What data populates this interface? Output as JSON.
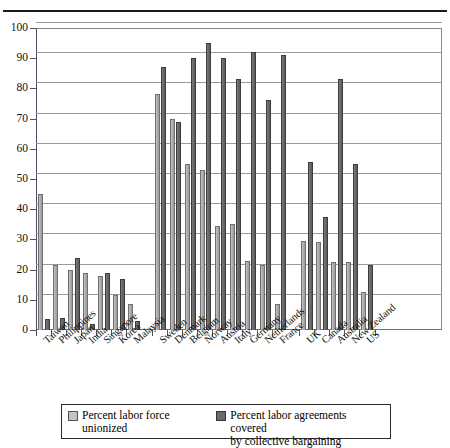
{
  "chart_data": {
    "type": "bar",
    "title": "",
    "xlabel": "",
    "ylabel": "",
    "ylim": [
      0,
      100
    ],
    "ytick_step": 10,
    "yticks": [
      100,
      90,
      80,
      70,
      60,
      50,
      40,
      30,
      20,
      10,
      0
    ],
    "grid": true,
    "legend_position": "bottom",
    "categories": [
      "Taiwan",
      "Philippines",
      "Japan",
      "India",
      "Singapore",
      "Korea",
      "Malaysia",
      "Sweden",
      "Denmark",
      "Belgium",
      "Norway",
      "Austria",
      "Italy",
      "Germany",
      "Netherlands",
      "France",
      "UK",
      "Canada",
      "Australia",
      "New Zealand",
      "US"
    ],
    "groups": [
      {
        "name": "asia",
        "categories": [
          "Taiwan",
          "Philippines",
          "Japan",
          "India",
          "Singapore",
          "Korea",
          "Malaysia"
        ]
      },
      {
        "name": "europe",
        "categories": [
          "Sweden",
          "Denmark",
          "Belgium",
          "Norway",
          "Austria",
          "Italy",
          "Germany",
          "Netherlands",
          "France"
        ]
      },
      {
        "name": "anglo",
        "categories": [
          "UK",
          "Canada",
          "Australia",
          "New Zealand",
          "US"
        ]
      }
    ],
    "series": [
      {
        "name": "Percent labor force unionized",
        "color": "#aeaeae",
        "values": [
          45,
          21.5,
          20,
          19,
          18,
          11.5,
          8.5,
          78,
          70,
          55,
          53,
          34.5,
          35,
          23,
          21.5,
          8.5,
          29.5,
          29,
          22.5,
          22.5,
          12.5
        ]
      },
      {
        "name": "Percent labor agreements covered by collective bargaining",
        "color": "#6a6a6a",
        "values": [
          3.5,
          4,
          24,
          2,
          19,
          17,
          3,
          87,
          69,
          90,
          95,
          90,
          83,
          92,
          76,
          91,
          55.5,
          37.5,
          83,
          55,
          21.5
        ]
      }
    ]
  },
  "legend": {
    "entries": [
      {
        "label_line1": "Percent labor force",
        "label_line2": "unionized",
        "swatch": "light-gray-swatch"
      },
      {
        "label_line1": "Percent labor agreements covered",
        "label_line2": "by collective bargaining",
        "swatch": "dark-gray-swatch"
      }
    ]
  }
}
